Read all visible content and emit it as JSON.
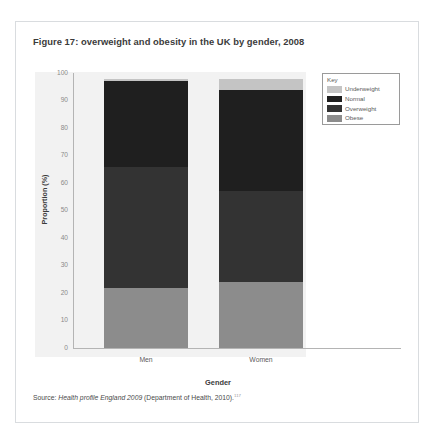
{
  "figure": {
    "title": "Figure 17: overweight and obesity in the UK by gender, 2008",
    "source_prefix": "Source: ",
    "source_italic": "Health profile England 2009",
    "source_suffix": " (Department of Health, 2010).",
    "source_superscript": "117"
  },
  "legend": {
    "title": "Key",
    "entries": [
      {
        "label": "Underweight",
        "color": "#c4c4c4"
      },
      {
        "label": "Normal",
        "color": "#1f1f1f"
      },
      {
        "label": "Overweight",
        "color": "#333333"
      },
      {
        "label": "Obese",
        "color": "#8c8c8c"
      }
    ]
  },
  "chart_data": {
    "type": "bar",
    "subtype": "stacked-vertical-100",
    "title": "Figure 17: overweight and obesity in the UK by gender, 2008",
    "xlabel": "Gender",
    "ylabel": "Proportion (%)",
    "categories": [
      "Men",
      "Women"
    ],
    "ylim": [
      0,
      100
    ],
    "yticks": [
      0,
      10,
      20,
      30,
      40,
      50,
      60,
      70,
      80,
      90,
      100
    ],
    "grid": false,
    "legend_position": "top-right",
    "series": [
      {
        "name": "Obese",
        "color": "#8c8c8c",
        "values": [
          22,
          24
        ]
      },
      {
        "name": "Overweight",
        "color": "#333333",
        "values": [
          44,
          33
        ]
      },
      {
        "name": "Normal",
        "color": "#1f1f1f",
        "values": [
          31,
          37
        ]
      },
      {
        "name": "Underweight",
        "color": "#c4c4c4",
        "values": [
          1,
          4
        ]
      }
    ],
    "totals": [
      98,
      98
    ]
  }
}
